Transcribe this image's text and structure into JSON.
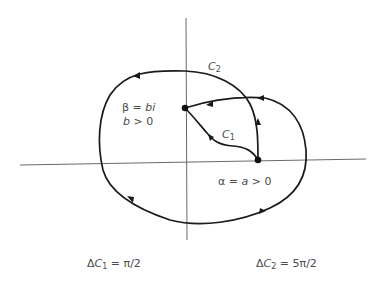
{
  "diagram": {
    "labels": {
      "c2": {
        "main": "C",
        "sub": "2"
      },
      "c1": {
        "main": "C",
        "sub": "1"
      },
      "beta_line1": {
        "sym": "β",
        "eq": " = ",
        "val": "bi"
      },
      "beta_line2": {
        "var": "b",
        "cond": " > 0"
      },
      "alpha": {
        "sym": "α",
        "eq": " = ",
        "var": "a",
        "cond": " > 0"
      },
      "delta_c1": {
        "delta": "Δ",
        "main": "C",
        "sub": "1",
        "eq": " = π/2"
      },
      "delta_c2": {
        "delta": "Δ",
        "main": "C",
        "sub": "2",
        "eq": " = 5π/2"
      }
    },
    "points": {
      "alpha": {
        "name": "α",
        "x": 258,
        "y": 160
      },
      "beta": {
        "name": "β",
        "x": 185,
        "y": 108
      }
    },
    "colors": {
      "curve": "#1a1a1a",
      "axis": "#6a6a6a",
      "text": "#4a4a4a"
    }
  }
}
